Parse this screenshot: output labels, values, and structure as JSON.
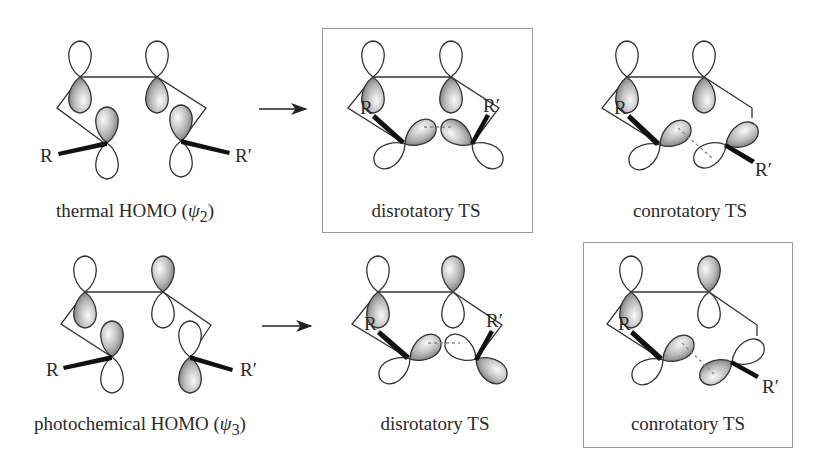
{
  "figure": {
    "colors": {
      "line": "#222222",
      "lobe_fill_light": "#f4f4f4",
      "lobe_fill_dark": "#7a7a7a",
      "frame": "#9a9a9a"
    }
  },
  "rows": [
    {
      "name": "thermal",
      "homo": {
        "label": "thermal HOMO (",
        "psi": "ψ",
        "sub": "2",
        "close": ")",
        "R": "R",
        "Rp": "R′"
      },
      "arrow": "→",
      "disrotatory": {
        "label": "disrotatory TS",
        "R": "R",
        "Rp": "R′",
        "boxed": true
      },
      "conrotatory": {
        "label": "conrotatory TS",
        "R": "R",
        "Rp": "R′",
        "boxed": false
      }
    },
    {
      "name": "photochemical",
      "homo": {
        "label": "photochemical HOMO (",
        "psi": "ψ",
        "sub": "3",
        "close": ")",
        "R": "R",
        "Rp": "R′"
      },
      "arrow": "→",
      "disrotatory": {
        "label": "disrotatory TS",
        "R": "R",
        "Rp": "R′",
        "boxed": false
      },
      "conrotatory": {
        "label": "conrotatory TS",
        "R": "R",
        "Rp": "R′",
        "boxed": true
      }
    }
  ]
}
